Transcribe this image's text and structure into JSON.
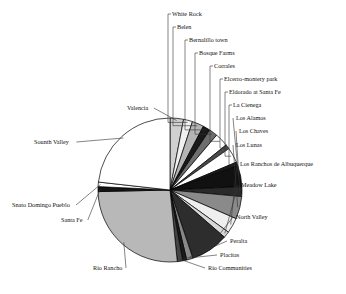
{
  "chart_data": {
    "type": "pie",
    "title": "",
    "subtitle": "",
    "xlabel": "",
    "ylabel": "",
    "legend_position": "none",
    "grid": false,
    "labels_style": "leader-lines",
    "start_angle_deg": -90,
    "direction": "clockwise",
    "categories": [
      "White Rock",
      "Belen",
      "Bernalillo town",
      "Bosque Farms",
      "Corrales",
      "Elcerro-montery park",
      "Eldorado at Santa Fe",
      "La Cienega",
      "Los Alamos",
      "Los Chaves",
      "Los Lunas",
      "Los Ranchos de Albuquerque",
      "Meadow Lake",
      "North Valley",
      "Peralta",
      "Placitas",
      "Rio Communities",
      "Rio Rancho",
      "Santa Fe",
      "Snato Domingo Pueblo",
      "Sounth Valley",
      "Valencia"
    ],
    "values": [
      2.0,
      2.6,
      1.6,
      1.9,
      3.0,
      1.0,
      3.4,
      0.9,
      4.6,
      2.2,
      5.0,
      3.4,
      1.4,
      8.4,
      1.4,
      0.9,
      1.2,
      26.0,
      1.1,
      1.0,
      23.0,
      3.0
    ],
    "colors": [
      "#f0f0f0",
      "#b4b4b4",
      "#1a1a1a",
      "#6e6e6e",
      "#ffffff",
      "#4a4a4a",
      "#ffffff",
      "#1a1a1a",
      "#111111",
      "#2a2a2a",
      "#8a8a8a",
      "#efefef",
      "#d8d8d8",
      "#2d2d2d",
      "#888888",
      "#1a1a1a",
      "#444444",
      "#b8b8b8",
      "#141414",
      "#ffffff",
      "#ffffff",
      "#d0d0d0"
    ]
  },
  "labels": [
    {
      "name": "White Rock",
      "text": "White Rock",
      "x": 172,
      "y": 16
    },
    {
      "name": "Belen",
      "text": "Belen",
      "x": 177,
      "y": 29
    },
    {
      "name": "Bernalillo town",
      "text": "Bernalillo town",
      "x": 189,
      "y": 42
    },
    {
      "name": "Bosque Farms",
      "text": "Bosque Farms",
      "x": 199,
      "y": 55
    },
    {
      "name": "Corrales",
      "text": "Corrales",
      "x": 214,
      "y": 68
    },
    {
      "name": "Elcerro-montery park",
      "text": "Elcerro-montery park",
      "x": 224,
      "y": 81
    },
    {
      "name": "Eldorado at Santa Fe",
      "text": "Eldorado at Santa Fe",
      "x": 229,
      "y": 94
    },
    {
      "name": "La Cienega",
      "text": "La Cienega",
      "x": 233,
      "y": 107
    },
    {
      "name": "Los Alamos",
      "text": "Los Alamos",
      "x": 236,
      "y": 120
    },
    {
      "name": "Los Chaves",
      "text": "Los Chaves",
      "x": 239,
      "y": 133
    },
    {
      "name": "Los Lunas",
      "text": "Los Lunas",
      "x": 236,
      "y": 147
    },
    {
      "name": "Los Ranchos de Albuquerque",
      "text": "Los Ranchos de Albuquerque",
      "x": 240,
      "y": 166
    },
    {
      "name": "Meadow Lake",
      "text": "Meadow Lake",
      "x": 241,
      "y": 187
    },
    {
      "name": "North Valley",
      "text": "North Valley",
      "x": 236,
      "y": 219
    },
    {
      "name": "Peralta",
      "text": "Peralta",
      "x": 230,
      "y": 243
    },
    {
      "name": "Placitas",
      "text": "Placitas",
      "x": 220,
      "y": 257
    },
    {
      "name": "Rio Communities",
      "text": "Rio Communities",
      "x": 208,
      "y": 270
    },
    {
      "name": "Rio Rancho",
      "text": "Rio Rancho",
      "x": 93,
      "y": 270
    },
    {
      "name": "Santa Fe",
      "text": "Santa Fe",
      "x": 61,
      "y": 222
    },
    {
      "name": "Snato Domingo Pueblo",
      "text": "Snato Domingo Pueblo",
      "x": 12,
      "y": 207
    },
    {
      "name": "Sounth Valley",
      "text": "Sounth Valley",
      "x": 34,
      "y": 144
    },
    {
      "name": "Valencia",
      "text": "Valencia",
      "x": 127,
      "y": 110
    }
  ]
}
